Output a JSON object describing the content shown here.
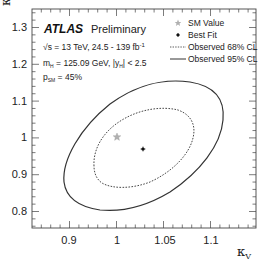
{
  "chart_data": {
    "type": "line",
    "title": "",
    "xlabel": "κ_V",
    "ylabel": "κ_F",
    "xlim": [
      0.855,
      1.145
    ],
    "ylim": [
      0.754,
      1.35
    ],
    "x_ticks": [
      0.9,
      1,
      1.05,
      1.1
    ],
    "x_tick_labels": [
      "0.9",
      "1",
      "1.05",
      "1.1"
    ],
    "y_ticks": [
      0.8,
      0.9,
      1.0,
      1.1,
      1.2,
      1.3
    ],
    "y_tick_labels": [
      "0.8",
      "0.9",
      "1",
      "1.1",
      "1.2",
      "1.3"
    ],
    "grid": false,
    "legend_position": "upper right",
    "annotations": {
      "experiment": "ATLAS",
      "status": "Preliminary",
      "energy_lumi": "√s = 13 TeV, 24.5 - 139 fb⁻¹",
      "mass_rapidity": "m_H = 125.09 GeV, |y_H| < 2.5",
      "p_sm": "p_SM = 45%"
    },
    "series": [
      {
        "name": "SM Value",
        "marker": "star",
        "color": "#aaaaaa",
        "x": [
          1.0
        ],
        "y": [
          1.0
        ]
      },
      {
        "name": "Best Fit",
        "marker": "cross-dot",
        "color": "#111111",
        "x": [
          1.027
        ],
        "y": [
          0.97
        ]
      },
      {
        "name": "Observed 68% CL",
        "style": "dashed",
        "color": "#333333",
        "contour": {
          "center": [
            1.03,
            1.02
          ],
          "x_range": [
            0.96,
            1.085
          ],
          "y_range": [
            0.89,
            1.17
          ]
        }
      },
      {
        "name": "Observed 95% CL",
        "style": "solid",
        "color": "#333333",
        "contour": {
          "center": [
            1.03,
            1.03
          ],
          "x_range": [
            0.89,
            1.13
          ],
          "y_range": [
            0.8,
            1.25
          ]
        }
      }
    ]
  },
  "axes": {
    "x_title": "κ",
    "x_title_sub": "V",
    "y_title": "κ",
    "y_title_sub": "F"
  },
  "legend": {
    "items": [
      {
        "label": "SM Value"
      },
      {
        "label": "Best Fit"
      },
      {
        "label": "Observed 68% CL"
      },
      {
        "label": "Observed 95% CL"
      }
    ]
  },
  "info": {
    "atlas": "ATLAS",
    "preliminary": "Preliminary",
    "line1_prefix": "√s = 13 TeV, 24.5 - 139 fb",
    "line1_sup": "-1",
    "line2_m": "m",
    "line2_m_sub": "H",
    "line2_mid": " = 125.09 GeV, |y",
    "line2_y_sub": "H",
    "line2_end": "| < 2.5",
    "line3_p": "p",
    "line3_p_sub": "SM",
    "line3_end": " = 45%"
  }
}
